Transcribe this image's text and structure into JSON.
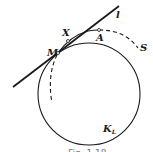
{
  "diagram": {
    "labels": {
      "line": "l",
      "point_m": "M",
      "point_x": "X",
      "point_a": "A",
      "curve_s": "S",
      "circle": "K",
      "circle_sub": "L"
    },
    "caption": "Fig. 1.18",
    "colors": {
      "ink": "#1a1a1a",
      "background": "#ffffff"
    }
  }
}
